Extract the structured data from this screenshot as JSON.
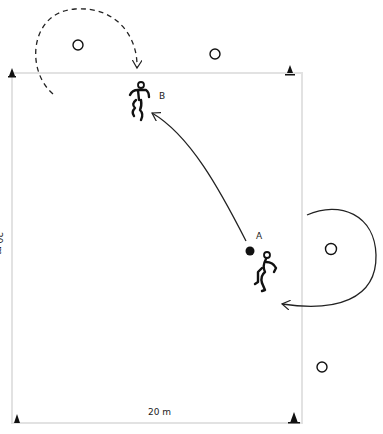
{
  "diagram": {
    "type": "soccer-drill",
    "field": {
      "x": 12,
      "y": 73,
      "width": 290,
      "height": 350,
      "border_color": "#e0e0e0"
    },
    "dimensions": {
      "width_label": "20 m",
      "height_label": "20 m"
    },
    "players": [
      {
        "id": "A",
        "label": "A",
        "x": 265,
        "y": 273
      },
      {
        "id": "B",
        "label": "B",
        "x": 138,
        "y": 100
      }
    ],
    "ball": {
      "x": 250,
      "y": 251
    },
    "cones": [
      {
        "x": 12,
        "y": 72
      },
      {
        "x": 290,
        "y": 72
      },
      {
        "x": 16,
        "y": 419
      },
      {
        "x": 294,
        "y": 419
      }
    ],
    "markers": [
      {
        "x": 78,
        "y": 45
      },
      {
        "x": 215,
        "y": 54
      },
      {
        "x": 331,
        "y": 249
      },
      {
        "x": 322,
        "y": 367
      }
    ],
    "arrows": [
      {
        "type": "pass",
        "style": "solid",
        "from": "A",
        "to": "B"
      },
      {
        "type": "run",
        "style": "dashed",
        "player": "B"
      },
      {
        "type": "run",
        "style": "solid",
        "player": "A"
      }
    ]
  }
}
